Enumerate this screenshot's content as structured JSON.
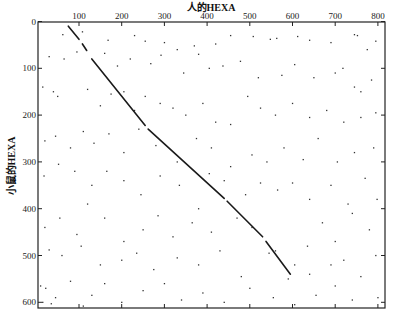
{
  "chart_data": {
    "type": "scatter",
    "title": "人的HEXA",
    "xlabel": "人的HEXA",
    "ylabel": "小鼠的HEXA",
    "xlim": [
      0,
      815
    ],
    "ylim": [
      0,
      615
    ],
    "y_inverted": true,
    "grid": false,
    "xticks": [
      100,
      200,
      300,
      400,
      500,
      600,
      700,
      800
    ],
    "yticks": [
      0,
      100,
      200,
      300,
      400,
      500,
      600
    ],
    "diagonal": {
      "description": "dot-plot alignment diagonal (human HEXA vs mouse HEXA)",
      "start": [
        75,
        10
      ],
      "end": [
        595,
        540
      ],
      "segments": [
        [
          [
            75,
            10
          ],
          [
            100,
            38
          ]
        ],
        [
          [
            108,
            48
          ],
          [
            118,
            62
          ]
        ],
        [
          [
            130,
            80
          ],
          [
            255,
            222
          ]
        ],
        [
          [
            262,
            230
          ],
          [
            440,
            378
          ]
        ],
        [
          [
            447,
            384
          ],
          [
            530,
            460
          ]
        ],
        [
          [
            538,
            470
          ],
          [
            595,
            540
          ]
        ]
      ]
    },
    "points": [
      [
        62,
        28
      ],
      [
        108,
        22
      ],
      [
        168,
        40
      ],
      [
        230,
        30
      ],
      [
        255,
        42
      ],
      [
        300,
        45
      ],
      [
        330,
        60
      ],
      [
        370,
        52
      ],
      [
        420,
        48
      ],
      [
        455,
        30
      ],
      [
        508,
        32
      ],
      [
        548,
        38
      ],
      [
        563,
        36
      ],
      [
        612,
        32
      ],
      [
        640,
        40
      ],
      [
        690,
        45
      ],
      [
        745,
        28
      ],
      [
        752,
        30
      ],
      [
        795,
        42
      ],
      [
        718,
        100
      ],
      [
        775,
        60
      ],
      [
        30,
        75
      ],
      [
        65,
        80
      ],
      [
        95,
        65
      ],
      [
        160,
        68
      ],
      [
        190,
        95
      ],
      [
        220,
        80
      ],
      [
        268,
        90
      ],
      [
        292,
        72
      ],
      [
        345,
        110
      ],
      [
        380,
        70
      ],
      [
        405,
        100
      ],
      [
        437,
        95
      ],
      [
        478,
        85
      ],
      [
        520,
        120
      ],
      [
        575,
        115
      ],
      [
        605,
        92
      ],
      [
        650,
        120
      ],
      [
        700,
        110
      ],
      [
        745,
        140
      ],
      [
        760,
        150
      ],
      [
        785,
        125
      ],
      [
        15,
        140
      ],
      [
        40,
        150
      ],
      [
        50,
        160
      ],
      [
        120,
        145
      ],
      [
        150,
        180
      ],
      [
        175,
        155
      ],
      [
        205,
        150
      ],
      [
        230,
        190
      ],
      [
        255,
        160
      ],
      [
        290,
        175
      ],
      [
        320,
        185
      ],
      [
        350,
        200
      ],
      [
        390,
        175
      ],
      [
        420,
        215
      ],
      [
        455,
        220
      ],
      [
        495,
        160
      ],
      [
        525,
        185
      ],
      [
        560,
        200
      ],
      [
        600,
        175
      ],
      [
        640,
        205
      ],
      [
        680,
        190
      ],
      [
        720,
        215
      ],
      [
        760,
        205
      ],
      [
        795,
        195
      ],
      [
        20,
        255
      ],
      [
        45,
        245
      ],
      [
        80,
        270
      ],
      [
        110,
        235
      ],
      [
        135,
        260
      ],
      [
        170,
        240
      ],
      [
        205,
        280
      ],
      [
        240,
        230
      ],
      [
        280,
        265
      ],
      [
        330,
        300
      ],
      [
        375,
        250
      ],
      [
        410,
        270
      ],
      [
        455,
        310
      ],
      [
        505,
        285
      ],
      [
        540,
        300
      ],
      [
        580,
        270
      ],
      [
        625,
        295
      ],
      [
        660,
        250
      ],
      [
        705,
        300
      ],
      [
        745,
        280
      ],
      [
        790,
        270
      ],
      [
        18,
        330
      ],
      [
        52,
        305
      ],
      [
        90,
        320
      ],
      [
        130,
        350
      ],
      [
        165,
        320
      ],
      [
        205,
        340
      ],
      [
        245,
        370
      ],
      [
        290,
        330
      ],
      [
        335,
        350
      ],
      [
        380,
        400
      ],
      [
        405,
        325
      ],
      [
        440,
        340
      ],
      [
        490,
        370
      ],
      [
        525,
        345
      ],
      [
        565,
        360
      ],
      [
        600,
        345
      ],
      [
        640,
        380
      ],
      [
        690,
        350
      ],
      [
        730,
        390
      ],
      [
        770,
        335
      ],
      [
        798,
        380
      ],
      [
        20,
        440
      ],
      [
        55,
        420
      ],
      [
        95,
        455
      ],
      [
        120,
        390
      ],
      [
        160,
        420
      ],
      [
        205,
        470
      ],
      [
        250,
        445
      ],
      [
        285,
        415
      ],
      [
        320,
        460
      ],
      [
        365,
        430
      ],
      [
        410,
        450
      ],
      [
        470,
        420
      ],
      [
        505,
        440
      ],
      [
        560,
        490
      ],
      [
        605,
        520
      ],
      [
        635,
        480
      ],
      [
        670,
        430
      ],
      [
        700,
        470
      ],
      [
        740,
        410
      ],
      [
        780,
        445
      ],
      [
        30,
        488
      ],
      [
        60,
        500
      ],
      [
        105,
        480
      ],
      [
        150,
        520
      ],
      [
        200,
        510
      ],
      [
        235,
        495
      ],
      [
        275,
        530
      ],
      [
        330,
        505
      ],
      [
        380,
        520
      ],
      [
        430,
        490
      ],
      [
        480,
        545
      ],
      [
        545,
        495
      ],
      [
        590,
        550
      ],
      [
        640,
        540
      ],
      [
        690,
        520
      ],
      [
        720,
        510
      ],
      [
        760,
        545
      ],
      [
        795,
        500
      ],
      [
        10,
        565
      ],
      [
        22,
        570
      ],
      [
        45,
        590
      ],
      [
        80,
        555
      ],
      [
        130,
        585
      ],
      [
        160,
        560
      ],
      [
        200,
        600
      ],
      [
        250,
        575
      ],
      [
        300,
        560
      ],
      [
        340,
        595
      ],
      [
        390,
        580
      ],
      [
        440,
        600
      ],
      [
        500,
        570
      ],
      [
        555,
        590
      ],
      [
        605,
        605
      ],
      [
        655,
        585
      ],
      [
        700,
        565
      ],
      [
        740,
        595
      ],
      [
        800,
        590
      ],
      [
        15,
        600
      ],
      [
        35,
        603
      ],
      [
        110,
        608
      ]
    ]
  }
}
